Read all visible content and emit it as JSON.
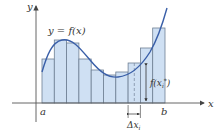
{
  "diagram": {
    "labels": {
      "y_axis": "y",
      "x_axis": "x",
      "curve": "y = f(x)",
      "a": "a",
      "b": "b",
      "delta": "Δx",
      "delta_sub": "i",
      "height": "f(x",
      "height_sub": "i",
      "height_sup": "*",
      "height_close": ")"
    },
    "colors": {
      "curve": "#3a5fa8",
      "rect_fill": "#cfe0f3",
      "rect_stroke": "#6e7f93",
      "axis": "#555555"
    },
    "rectangles": [
      {
        "x": 42,
        "w": 12.3,
        "top": 59
      },
      {
        "x": 54.3,
        "w": 12.3,
        "top": 40
      },
      {
        "x": 66.6,
        "w": 12.3,
        "top": 43
      },
      {
        "x": 78.9,
        "w": 12.3,
        "top": 59
      },
      {
        "x": 91.2,
        "w": 12.3,
        "top": 70
      },
      {
        "x": 103.5,
        "w": 12.3,
        "top": 75
      },
      {
        "x": 115.8,
        "w": 12.3,
        "top": 72
      },
      {
        "x": 128.1,
        "w": 12.3,
        "top": 63
      },
      {
        "x": 140.4,
        "w": 12.3,
        "top": 48
      },
      {
        "x": 152.7,
        "w": 12.3,
        "top": 28
      }
    ],
    "highlighted_index": 7
  }
}
